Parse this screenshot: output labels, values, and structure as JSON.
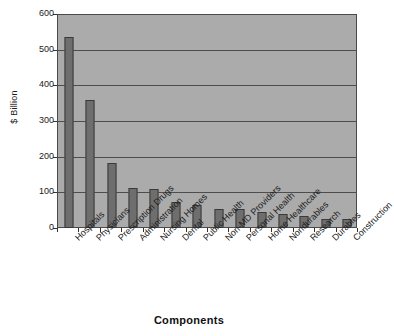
{
  "chart_data": {
    "type": "bar",
    "title": "",
    "xlabel": "Components",
    "ylabel": "$ Billion",
    "ylim": [
      0,
      600
    ],
    "yticks": [
      0,
      100,
      200,
      300,
      400,
      500,
      600
    ],
    "ytick_labels": [
      "0",
      "100",
      "200",
      "300",
      "400",
      "500",
      "600"
    ],
    "grid": true,
    "legend": "none",
    "categories": [
      "Hospitals",
      "Physicians",
      "Prescription Drugs",
      "Administration",
      "Nursing Homes",
      "Dental",
      "Public Health",
      "Non-MD Providers",
      "Personal Health",
      "Home Healthcare",
      "Nondurables",
      "Research",
      "Durables",
      "Construction"
    ],
    "values": [
      535,
      360,
      182,
      113,
      108,
      72,
      65,
      52,
      52,
      46,
      40,
      33,
      25,
      24
    ],
    "colors": {
      "bar_fill": "#6e6e6e",
      "bar_stroke": "#3a3a3a",
      "plot_background": "#ababab",
      "gridline": "#4d4d4d",
      "axis": "#333333",
      "text": "#1a1a1a",
      "figure_background": "#ffffff"
    }
  }
}
